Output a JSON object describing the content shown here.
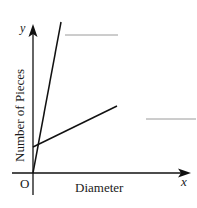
{
  "diagram": {
    "axes": {
      "x_label": "x",
      "y_label": "y",
      "origin_label": "O",
      "x_title": "Diameter",
      "y_title": "Number of Pieces"
    },
    "lines": [
      {
        "name": "steep-line",
        "from": [
          33,
          173
        ],
        "to": [
          61,
          22
        ]
      },
      {
        "name": "shallow-line",
        "from": [
          33,
          147
        ],
        "to": [
          117,
          106
        ]
      }
    ],
    "blanks": [
      {
        "name": "blank-line-top",
        "from": [
          65,
          35
        ],
        "to": [
          118,
          35
        ]
      },
      {
        "name": "blank-line-middle",
        "from": [
          146,
          119
        ],
        "to": [
          196,
          119
        ]
      }
    ],
    "colors": {
      "ink": "#111111",
      "blank": "#9a9a9a"
    }
  }
}
